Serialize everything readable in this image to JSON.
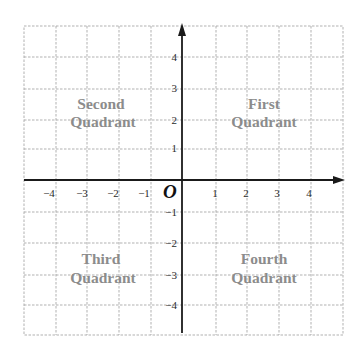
{
  "diagram": {
    "origin_label": "O",
    "x_ticks": [
      {
        "value": -4,
        "label": "−4"
      },
      {
        "value": -3,
        "label": "−3"
      },
      {
        "value": -2,
        "label": "−2"
      },
      {
        "value": -1,
        "label": "−1"
      },
      {
        "value": 1,
        "label": "1"
      },
      {
        "value": 2,
        "label": "2"
      },
      {
        "value": 3,
        "label": "3"
      },
      {
        "value": 4,
        "label": "4"
      }
    ],
    "y_ticks": [
      {
        "value": 4,
        "label": "4"
      },
      {
        "value": 3,
        "label": "3"
      },
      {
        "value": 2,
        "label": "2"
      },
      {
        "value": 1,
        "label": "1"
      },
      {
        "value": -1,
        "label": "−1"
      },
      {
        "value": -2,
        "label": "−2"
      },
      {
        "value": -3,
        "label": "−3"
      },
      {
        "value": -4,
        "label": "−4"
      }
    ],
    "quadrants": {
      "first": {
        "line1": "First",
        "line2": "Quadrant"
      },
      "second": {
        "line1": "Second",
        "line2": "Quadrant"
      },
      "third": {
        "line1": "Third",
        "line2": "Quadrant"
      },
      "fourth": {
        "line1": "Fourth",
        "line2": "Quadrant"
      }
    },
    "colors": {
      "grid": "#a8a8a8",
      "axis": "#1a1a1a",
      "quadrant_text": "#8c8c8c",
      "tick_text": "#2a2a2a"
    },
    "x_range": [
      -5,
      5
    ],
    "y_range": [
      -5,
      5
    ]
  }
}
